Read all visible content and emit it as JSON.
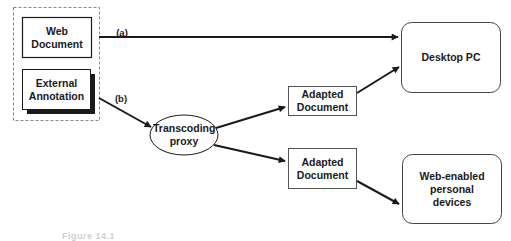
{
  "diagram": {
    "source_group": {
      "web_document": "Web Document",
      "external_annotation": "External Annotation"
    },
    "edges": {
      "a_label": "(a)",
      "b_label": "(b)"
    },
    "proxy": "Transcoding proxy",
    "adapted_top": "Adapted Document",
    "adapted_bottom": "Adapted Document",
    "desktop": "Desktop PC",
    "devices": "Web-enabled personal devices",
    "caption": "Figure 14.1"
  },
  "colors": {
    "stroke": "#1a1a1a",
    "dashed": "#888888",
    "background": "#ffffff"
  }
}
